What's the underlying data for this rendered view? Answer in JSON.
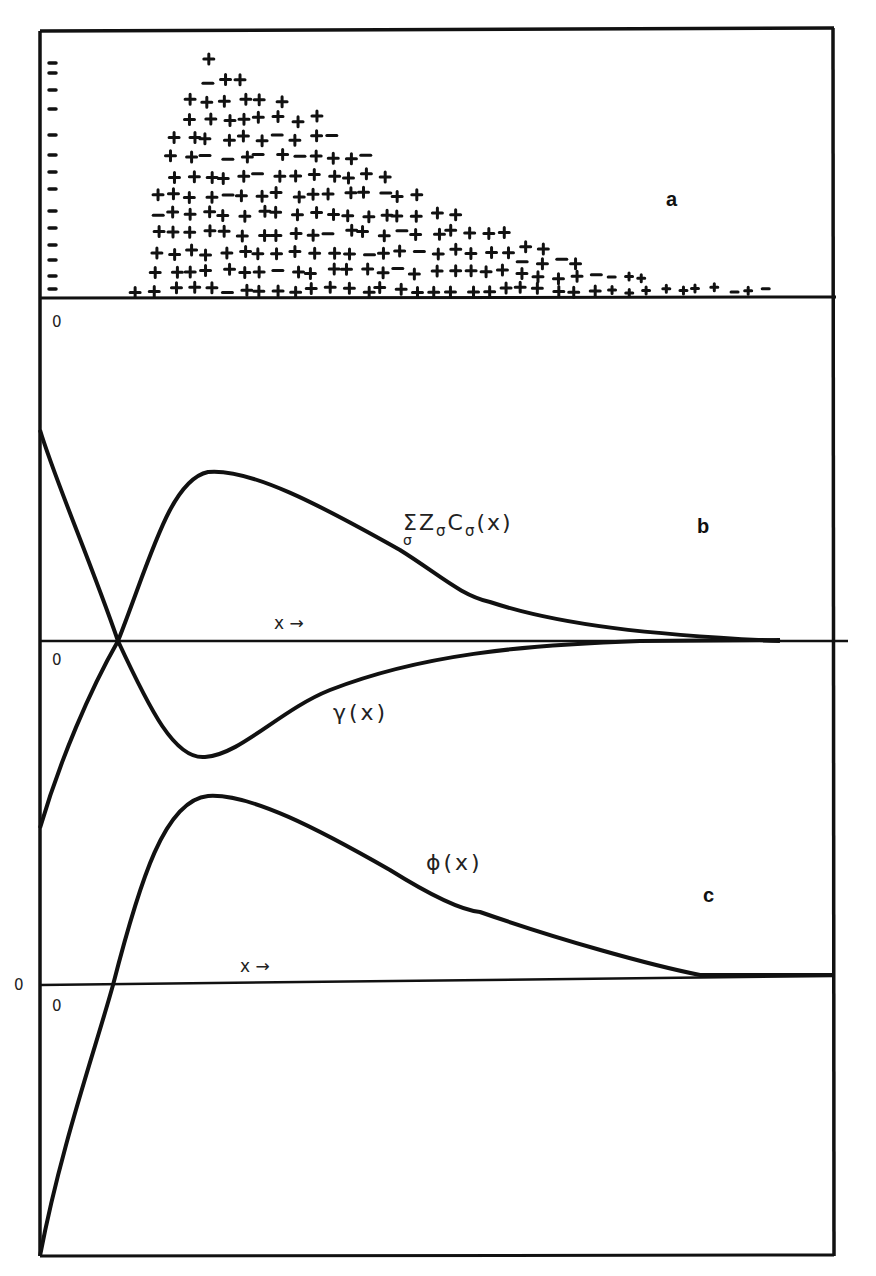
{
  "figure": {
    "panels": [
      {
        "id": "a",
        "letter": "a",
        "description": "charge distribution: negative charges (minus signs) along left wall, positive charges (plus signs) distributed in diffuse layer"
      },
      {
        "id": "b",
        "letter": "b",
        "axis_origin": "0",
        "axis_label": "x →"
      },
      {
        "id": "c",
        "letter": "c",
        "axis_origin": "0",
        "outer_origin": "0",
        "axis_label": "x →"
      }
    ],
    "labels": {
      "panel_a": "a",
      "panel_b": "b",
      "panel_c": "c",
      "origin_a": "0",
      "origin_b": "0",
      "origin_c_inner": "0",
      "origin_c_outer": "0",
      "x_arrow_b": "x →",
      "x_arrow_c": "x →",
      "sum_label_main": "ΣZ",
      "sum_label_sub1": "σ",
      "sum_label_c": "C",
      "sum_label_sub2": "σ",
      "sum_label_arg": "(x)",
      "sum_label_under": "σ",
      "gamma_label": "γ(x)",
      "phi_label": "ϕ(x)"
    }
  },
  "chart_data": [
    {
      "type": "scatter",
      "title": "a",
      "description": "Schematic charge distribution: column of negative charges at the wall (x=0), diffuse cloud of positive charges rising sharply to a maximum near x≈0.21 then decaying to zero",
      "series": [
        {
          "name": "negative wall charges",
          "marker": "−",
          "x": [
            0.02
          ],
          "count": 20
        },
        {
          "name": "positive diffuse charge envelope (height, normalized)",
          "x": [
            0.12,
            0.15,
            0.21,
            0.27,
            0.35,
            0.45,
            0.55,
            0.65,
            0.75,
            0.85,
            1.0
          ],
          "values": [
            0.0,
            0.55,
            1.0,
            0.88,
            0.72,
            0.5,
            0.32,
            0.18,
            0.1,
            0.05,
            0.02
          ]
        }
      ],
      "xlabel": "",
      "ylabel": "",
      "grid": false
    },
    {
      "type": "line",
      "title": "b",
      "xlabel": "x →",
      "ylabel": "",
      "origin_label": "0",
      "series": [
        {
          "name": "Σ_σ Z_σ C_σ(x)",
          "x": [
            0.0,
            0.05,
            0.1,
            0.15,
            0.21,
            0.3,
            0.4,
            0.55,
            0.7,
            0.85,
            0.94
          ],
          "values": [
            -0.55,
            -0.28,
            0.0,
            0.35,
            0.5,
            0.42,
            0.3,
            0.12,
            0.04,
            0.01,
            0.0
          ]
        },
        {
          "name": "γ(x)",
          "x": [
            0.0,
            0.05,
            0.1,
            0.15,
            0.21,
            0.3,
            0.4,
            0.55,
            0.7,
            0.85,
            0.94
          ],
          "values": [
            0.62,
            0.3,
            0.0,
            -0.25,
            -0.34,
            -0.25,
            -0.14,
            -0.05,
            -0.015,
            -0.003,
            0.0
          ]
        }
      ],
      "grid": false
    },
    {
      "type": "line",
      "title": "c",
      "xlabel": "x →",
      "ylabel": "",
      "origin_label": "0",
      "series": [
        {
          "name": "ϕ(x)",
          "x": [
            0.0,
            0.04,
            0.09,
            0.15,
            0.21,
            0.3,
            0.4,
            0.55,
            0.7,
            0.85,
            1.0
          ],
          "values": [
            -0.79,
            -0.35,
            0.0,
            0.4,
            0.55,
            0.5,
            0.36,
            0.18,
            0.07,
            0.01,
            0.01
          ]
        }
      ],
      "grid": false
    }
  ]
}
